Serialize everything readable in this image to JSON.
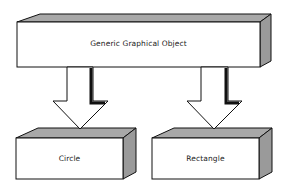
{
  "diagram": {
    "parent": {
      "label": "Generic Graphical Object"
    },
    "children": [
      {
        "label": "Circle"
      },
      {
        "label": "Rectangle"
      }
    ],
    "relation": "inheritance-arrows"
  },
  "colors": {
    "face": "#ffffff",
    "side": "#9a9a9a",
    "top": "#a8a8a8",
    "outline": "#111111"
  }
}
